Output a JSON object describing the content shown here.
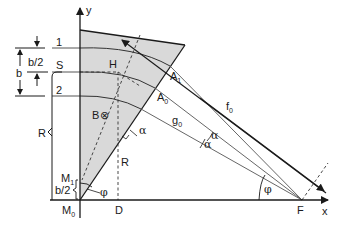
{
  "diagram": {
    "type": "geometric construction (magnetic sector / focusing geometry)",
    "colors": {
      "wedge_fill": "#d9d9d9",
      "line": "#1a1a1a",
      "thin_line": "#555555",
      "background": "#ffffff"
    },
    "axes": {
      "x_label": "x",
      "y_label": "y"
    },
    "points": {
      "S": "S",
      "H": "H",
      "A1_base": "A",
      "A1_sub": "1",
      "A0_base": "A",
      "A0_sub": "0",
      "B": "B",
      "B_symbol": "⊗",
      "M1_base": "M",
      "M1_sub": "1",
      "M0_base": "M",
      "M0_sub": "0",
      "D": "D",
      "F": "F"
    },
    "beams": {
      "beam1": "1",
      "beam2": "2"
    },
    "dimensions": {
      "b": "b",
      "b_half": "b/2",
      "b_half_bottom": "b/2",
      "R_left": "R",
      "R_inner": "R",
      "g0_base": "g",
      "g0_sub": "0",
      "f0_base": "f",
      "f0_sub": "0"
    },
    "angles": {
      "alpha_edge": "α",
      "alpha_upper": "α",
      "alpha_lower": "α",
      "phi_bottom": "φ",
      "phi_F": "φ"
    }
  }
}
